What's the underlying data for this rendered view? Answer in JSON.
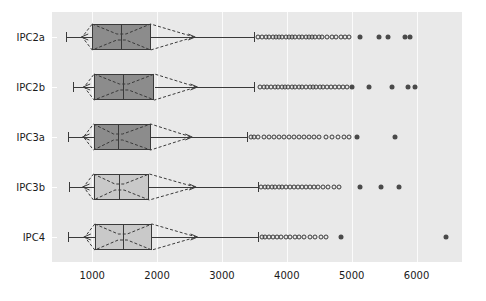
{
  "chart_data": {
    "type": "box",
    "title": "",
    "xlabel": "",
    "ylabel": "",
    "orientation": "horizontal",
    "grid": true,
    "legend": null,
    "xlim": [
      380,
      6700
    ],
    "xticks": [
      1000,
      2000,
      3000,
      4000,
      5000,
      6000
    ],
    "xtick_labels": [
      "1000",
      "2000",
      "3000",
      "4000",
      "5000",
      "6000"
    ],
    "categories": [
      "IPC2a",
      "IPC2b",
      "IPC3a",
      "IPC3b",
      "IPC4"
    ],
    "colors": {
      "plot_background": "#e9e9e9",
      "gridline": "#fbfbfb",
      "box_dark": "#8c8c8c",
      "box_light": "#c9c9c9",
      "line": "#3a3a3a",
      "outlier_edge": "#3b3b3b",
      "outlier_fill": "#4a4a4a",
      "text": "#1a1a1a",
      "figure_background": "#ffffff"
    },
    "series": [
      {
        "name": "IPC2a",
        "box_shade": "dark",
        "whisker_low": 600,
        "q1": 1000,
        "median": 1450,
        "q3": 1900,
        "whisker_high": 3500,
        "notch_low": 1380,
        "notch_high": 1520,
        "outliers_open": [
          3560,
          3620,
          3680,
          3720,
          3780,
          3830,
          3880,
          3930,
          3980,
          4030,
          4080,
          4130,
          4180,
          4230,
          4290,
          4340,
          4390,
          4440,
          4490,
          4540,
          4620,
          4700,
          4760,
          4830,
          4900,
          4960
        ],
        "outliers_filled": [
          5130,
          5420,
          5560,
          5820,
          5900
        ]
      },
      {
        "name": "IPC2b",
        "box_shade": "dark",
        "whisker_low": 700,
        "q1": 1030,
        "median": 1480,
        "q3": 1960,
        "whisker_high": 3500,
        "notch_low": 1420,
        "notch_high": 1560,
        "outliers_open": [
          3590,
          3650,
          3700,
          3760,
          3810,
          3870,
          3920,
          3970,
          4020,
          4080,
          4130,
          4180,
          4240,
          4290,
          4350,
          4400,
          4450,
          4510,
          4560,
          4620,
          4680,
          4740,
          4800,
          4860,
          4920
        ],
        "outliers_filled": [
          5010,
          5260,
          5620,
          5870,
          5970
        ]
      },
      {
        "name": "IPC3a",
        "box_shade": "dark",
        "whisker_low": 620,
        "q1": 1020,
        "median": 1400,
        "q3": 1900,
        "whisker_high": 3390,
        "notch_low": 1330,
        "notch_high": 1470,
        "outliers_open": [
          3440,
          3500,
          3560,
          3650,
          3720,
          3800,
          3880,
          3960,
          4030,
          4110,
          4190,
          4260,
          4340,
          4420,
          4500,
          4600,
          4700,
          4790,
          4880,
          4960
        ],
        "outliers_filled": [
          5080,
          5660
        ]
      },
      {
        "name": "IPC3b",
        "box_shade": "light",
        "whisker_low": 640,
        "q1": 1020,
        "median": 1420,
        "q3": 1880,
        "whisker_high": 3560,
        "notch_low": 1350,
        "notch_high": 1490,
        "outliers_open": [
          3600,
          3660,
          3710,
          3770,
          3820,
          3880,
          3930,
          3990,
          4050,
          4110,
          4170,
          4230,
          4300,
          4360,
          4420,
          4480,
          4560,
          4640,
          4720,
          4800
        ],
        "outliers_filled": [
          5120,
          5450,
          5730
        ]
      },
      {
        "name": "IPC4",
        "box_shade": "light",
        "whisker_low": 630,
        "q1": 1040,
        "median": 1480,
        "q3": 1920,
        "whisker_high": 3560,
        "notch_low": 1400,
        "notch_high": 1540,
        "outliers_open": [
          3610,
          3670,
          3730,
          3790,
          3850,
          3910,
          3980,
          4050,
          4120,
          4190,
          4270,
          4350,
          4430,
          4520,
          4610
        ],
        "outliers_filled": [
          4840,
          6450
        ]
      }
    ]
  }
}
